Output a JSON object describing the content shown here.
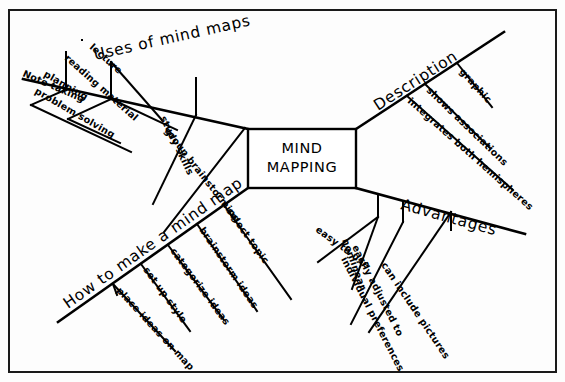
{
  "diagram": {
    "title": "MIND MAPPING",
    "center_label_line1": "MIND",
    "center_label_line2": "MAPPING",
    "colors": {
      "ink": "#000000",
      "frame": "#1a1a1a",
      "background": "#fdfdfd"
    },
    "branches": [
      {
        "id": "uses",
        "label": "Uses of mind maps",
        "position": "top-left",
        "children": [
          {
            "label": "Note taking"
          },
          {
            "label": "lecture"
          },
          {
            "label": "reading material"
          },
          {
            "label": "planning"
          },
          {
            "label": "problem solving"
          },
          {
            "label": "study skills"
          },
          {
            "label": "group brainstorming"
          }
        ]
      },
      {
        "id": "description",
        "label": "Description",
        "position": "top-right",
        "children": [
          {
            "label": "graphic"
          },
          {
            "label": "shows associations"
          },
          {
            "label": "integrates both hemispheres"
          }
        ]
      },
      {
        "id": "advantages",
        "label": "Advantages",
        "position": "bottom-right",
        "children": [
          {
            "label": "easy to use"
          },
          {
            "label": "nonlinear"
          },
          {
            "label": "easily adjusted to",
            "label2": "individual preferences"
          },
          {
            "label": "can include pictures"
          }
        ]
      },
      {
        "id": "howto",
        "label": "How to make a mind map",
        "position": "bottom-left",
        "children": [
          {
            "label": "select topic"
          },
          {
            "label": "brainstorm ideas"
          },
          {
            "label": "categorize ideas"
          },
          {
            "label": "set up style"
          },
          {
            "label": "place ideas on map"
          }
        ]
      }
    ]
  }
}
